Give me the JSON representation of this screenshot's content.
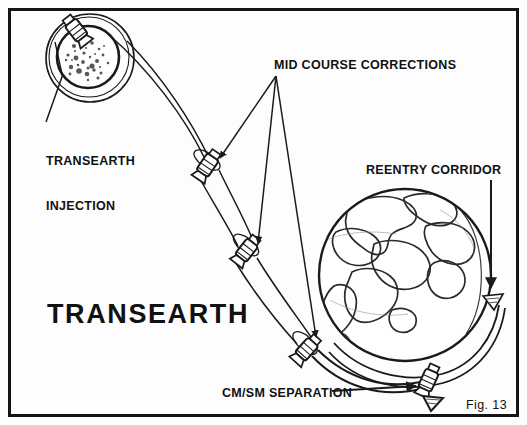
{
  "figure": {
    "title": "TRANSEARTH",
    "caption": "Fig. 13",
    "border_color": "#111111",
    "ink_color": "#1a1a1a",
    "background_color": "#fdfdfd"
  },
  "labels": {
    "transearth_injection_line1": "TRANSEARTH",
    "transearth_injection_line2": "INJECTION",
    "mid_course_corrections": "MID COURSE CORRECTIONS",
    "reentry_corridor": "REENTRY CORRIDOR",
    "cm_sm_separation": "CM/SM SEPARATION"
  },
  "diagram": {
    "type": "mission-trajectory-schematic",
    "bodies": [
      {
        "name": "moon",
        "cx": 88,
        "cy": 57,
        "radius": 31,
        "orbit_radius": 44,
        "surface": "cratered"
      },
      {
        "name": "earth",
        "cx": 405,
        "cy": 275,
        "radius": 86,
        "surface": "continents"
      }
    ],
    "spacecraft": [
      {
        "event": "transearth-injection",
        "x": 77,
        "y": 31,
        "angle": -35
      },
      {
        "event": "mid-course-correction-1",
        "x": 207,
        "y": 165,
        "angle": 35
      },
      {
        "event": "mid-course-correction-2",
        "x": 245,
        "y": 250,
        "angle": 38
      },
      {
        "event": "mid-course-correction-3",
        "x": 306,
        "y": 349,
        "angle": 42
      },
      {
        "event": "cm-sm-separation",
        "x": 428,
        "y": 381,
        "angle": 28
      }
    ],
    "arrows": [
      {
        "name": "reentry-corridor-arrow",
        "x1": 491,
        "y1": 180,
        "x2": 491,
        "y2": 280
      },
      {
        "name": "cm-sm-separation-leader",
        "x1": 330,
        "y1": 391,
        "x2": 418,
        "y2": 387
      }
    ]
  }
}
